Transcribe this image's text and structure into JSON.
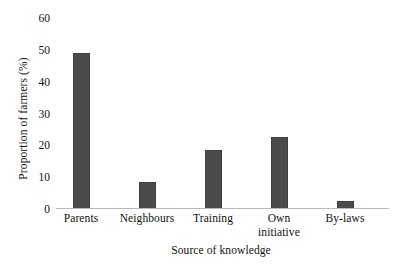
{
  "chart_data": {
    "type": "bar",
    "title": "",
    "subtitle": "",
    "xlabel": "Source of knowledge",
    "ylabel": "Proportion of farmers (%)",
    "categories": [
      "Parents",
      "Neighbours",
      "Training",
      "Own initiative",
      "By-laws"
    ],
    "values": [
      49,
      8.5,
      18.5,
      22.5,
      2.5
    ],
    "ylim": [
      0,
      60
    ],
    "yticks": [
      0,
      10,
      20,
      30,
      40,
      50,
      60
    ],
    "ytick_labels": [
      "0",
      "10",
      "20",
      "30",
      "40",
      "50",
      "60"
    ],
    "grid": false,
    "legend": null,
    "bar_color": "#4b4b4b",
    "axis_color": "#b9b9b9",
    "background": "#ffffff",
    "annotations": []
  },
  "axes": {
    "y_title": "Proportion of farmers (%)",
    "x_title": "Source of knowledge"
  },
  "x_labels": [
    {
      "line1": "Parents",
      "line2": ""
    },
    {
      "line1": "Neighbours",
      "line2": ""
    },
    {
      "line1": "Training",
      "line2": ""
    },
    {
      "line1": "Own",
      "line2": "initiative"
    },
    {
      "line1": "By-laws",
      "line2": ""
    }
  ]
}
